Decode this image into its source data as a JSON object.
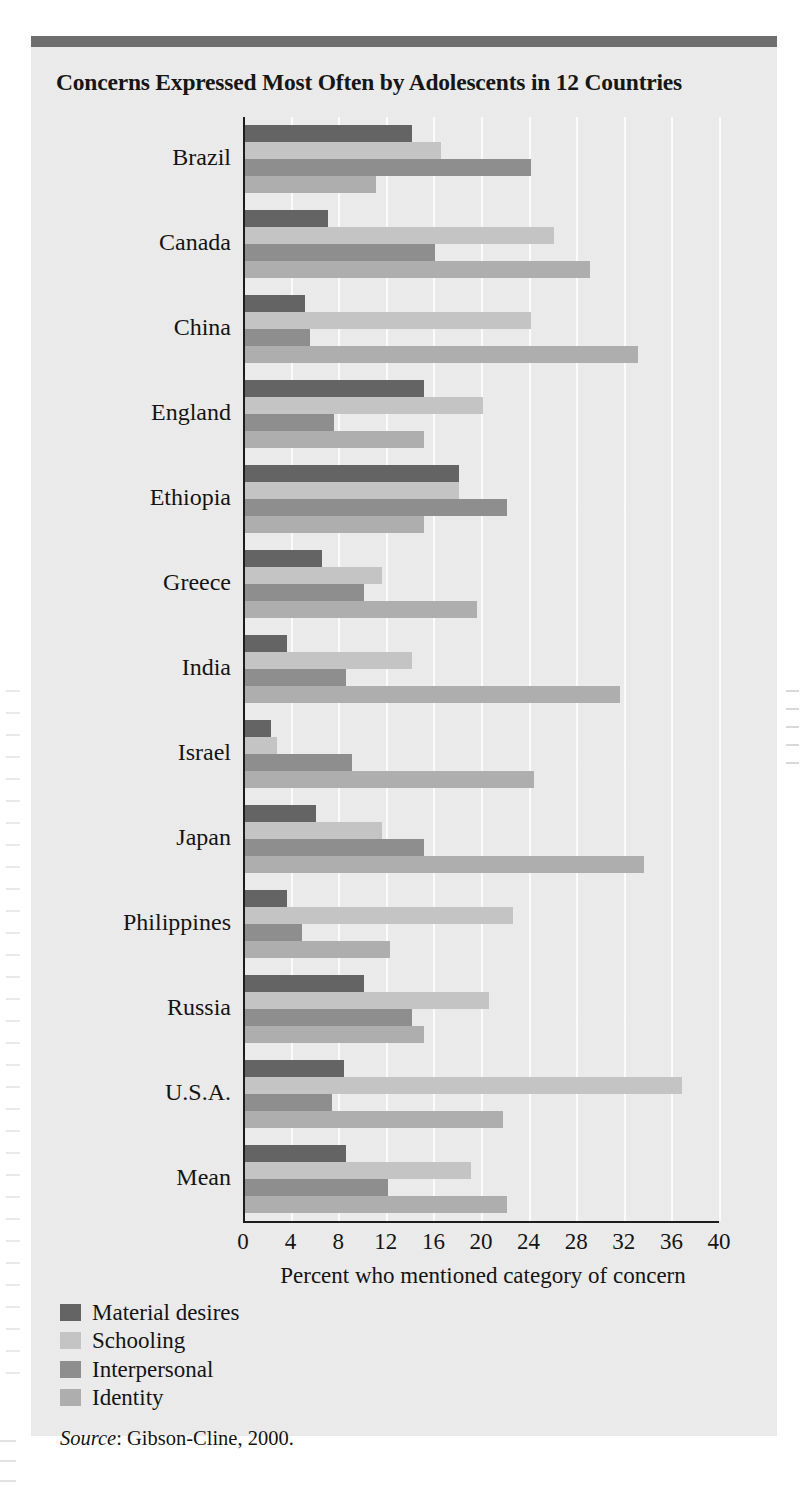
{
  "figure": {
    "title": "Concerns Expressed Most Often by Adolescents in 12 Countries",
    "source_word": "Source",
    "source_rest": ": Gibson-Cline, 2000."
  },
  "chart_data": {
    "type": "bar",
    "orientation": "horizontal",
    "title": "Concerns Expressed Most Often by Adolescents in 12 Countries",
    "xlabel": "Percent who mentioned category of concern",
    "ylabel": "",
    "xlim": [
      0,
      40
    ],
    "xticks": [
      0,
      4,
      8,
      12,
      16,
      20,
      24,
      28,
      32,
      36,
      40
    ],
    "xtick_labels": [
      "0",
      "4",
      "8",
      "12",
      "16",
      "20",
      "24",
      "28",
      "32",
      "36",
      "40"
    ],
    "grid": true,
    "grid_axis": "x",
    "legend_position": "below-left",
    "categories": [
      "Brazil",
      "Canada",
      "China",
      "England",
      "Ethiopia",
      "Greece",
      "India",
      "Israel",
      "Japan",
      "Philippines",
      "Russia",
      "U.S.A.",
      "Mean"
    ],
    "series": [
      {
        "name": "Material desires",
        "color": "#646464",
        "values": [
          14.0,
          7.0,
          5.0,
          15.0,
          18.0,
          6.5,
          3.5,
          2.2,
          6.0,
          3.5,
          10.0,
          8.3,
          8.5
        ]
      },
      {
        "name": "Schooling",
        "color": "#c4c4c4",
        "values": [
          16.5,
          26.0,
          24.0,
          20.0,
          18.0,
          11.5,
          14.0,
          2.7,
          11.5,
          22.5,
          20.5,
          36.7,
          19.0
        ]
      },
      {
        "name": "Interpersonal",
        "color": "#8e8e8e",
        "values": [
          24.0,
          16.0,
          5.5,
          7.5,
          22.0,
          10.0,
          8.5,
          9.0,
          15.0,
          4.8,
          14.0,
          7.3,
          12.0
        ]
      },
      {
        "name": "Identity",
        "color": "#aeaeae",
        "values": [
          11.0,
          29.0,
          33.0,
          15.0,
          15.0,
          19.5,
          31.5,
          24.3,
          33.5,
          12.2,
          15.0,
          21.7,
          22.0
        ]
      }
    ],
    "source": "Source: Gibson-Cline, 2000."
  }
}
